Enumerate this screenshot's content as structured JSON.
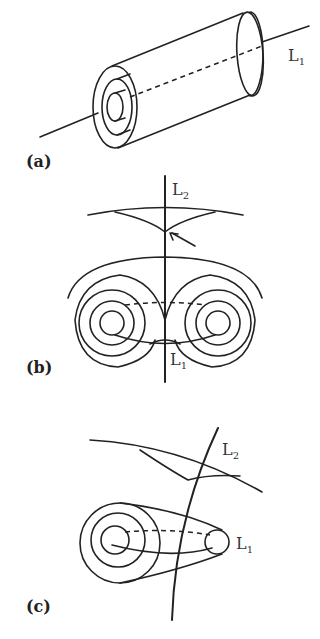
{
  "figure": {
    "panels": [
      {
        "id": "a",
        "label": "(a)",
        "lines": [
          {
            "name": "L",
            "sub": "1"
          }
        ]
      },
      {
        "id": "b",
        "label": "(b)",
        "lines": [
          {
            "name": "L",
            "sub": "2"
          },
          {
            "name": "L",
            "sub": "1"
          }
        ]
      },
      {
        "id": "c",
        "label": "(c)",
        "lines": [
          {
            "name": "L",
            "sub": "2"
          },
          {
            "name": "L",
            "sub": "1"
          }
        ]
      }
    ]
  }
}
